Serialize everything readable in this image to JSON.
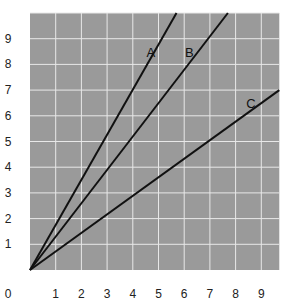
{
  "chart_data": {
    "type": "line",
    "title": "",
    "xlabel": "",
    "ylabel": "",
    "xlim": [
      0,
      9.7
    ],
    "ylim": [
      0,
      10
    ],
    "grid": true,
    "x_ticks": [
      "0",
      "1",
      "2",
      "3",
      "4",
      "5",
      "6",
      "7",
      "8",
      "9"
    ],
    "y_ticks": [
      "1",
      "2",
      "3",
      "4",
      "5",
      "6",
      "7",
      "8",
      "9"
    ],
    "series": [
      {
        "name": "A",
        "x": [
          0,
          5.7
        ],
        "y": [
          0,
          10
        ],
        "slope": 1.75
      },
      {
        "name": "B",
        "x": [
          0,
          7.7
        ],
        "y": [
          0,
          10
        ],
        "slope": 1.3
      },
      {
        "name": "C",
        "x": [
          0,
          9.7
        ],
        "y": [
          0,
          7.0
        ],
        "slope": 0.72
      }
    ],
    "annotations": [
      {
        "text": "A",
        "x": 4.7,
        "y": 8.5
      },
      {
        "text": "B",
        "x": 6.2,
        "y": 8.5
      },
      {
        "text": "C",
        "x": 8.6,
        "y": 6.5
      }
    ],
    "colors": {
      "plot_bg": "#9a9a9a",
      "grid": "#e8e8e8",
      "line": "#111111"
    }
  }
}
